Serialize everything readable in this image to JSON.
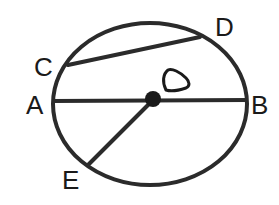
{
  "diagram": {
    "points": {
      "A": {
        "label": "A"
      },
      "B": {
        "label": "B"
      },
      "C": {
        "label": "C"
      },
      "D": {
        "label": "D"
      },
      "E": {
        "label": "E"
      }
    },
    "center_symbol": "center-mark",
    "segments": [
      {
        "name": "diameter",
        "from": "A",
        "to": "B"
      },
      {
        "name": "chord",
        "from": "C",
        "to": "D"
      },
      {
        "name": "radius",
        "from": "center",
        "to": "E"
      }
    ],
    "colors": {
      "stroke": "#2b2b2b",
      "background": "#ffffff"
    }
  }
}
